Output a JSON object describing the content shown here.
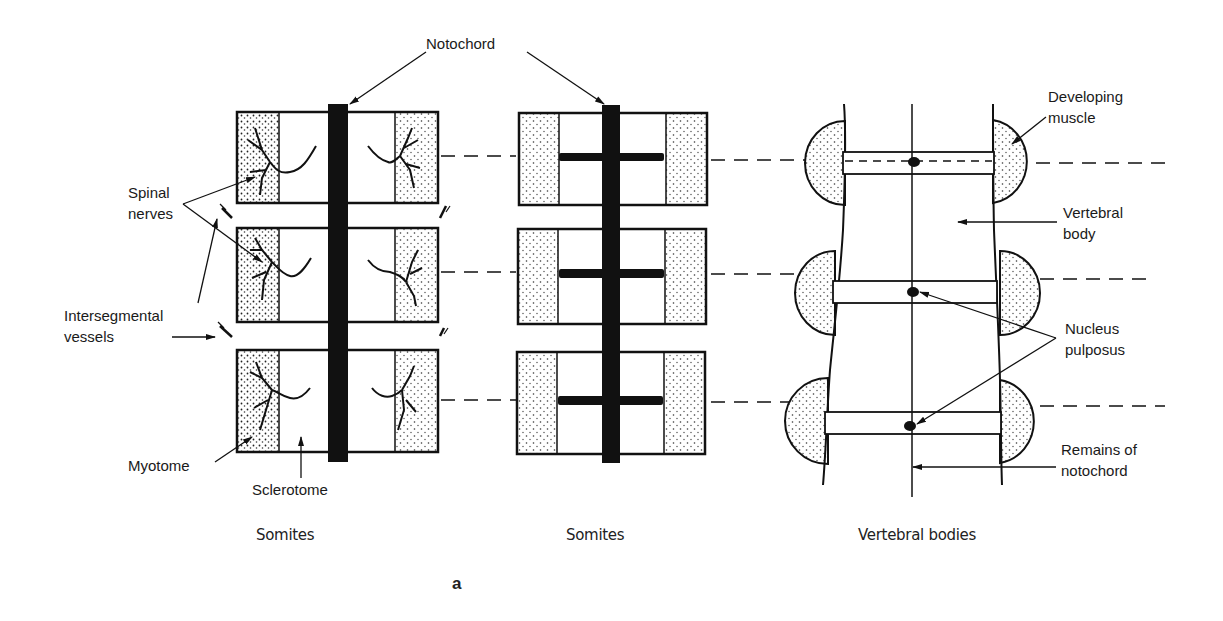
{
  "labels": {
    "notochord": "Notochord",
    "spinal_nerves_1": "Spinal",
    "spinal_nerves_2": "nerves",
    "intersegmental_1": "Intersegmental",
    "intersegmental_2": "vessels",
    "myotome": "Myotome",
    "sclerotome": "Sclerotome",
    "developing_muscle_1": "Developing",
    "developing_muscle_2": "muscle",
    "vertebral_body_1": "Vertebral",
    "vertebral_body_2": "body",
    "nucleus_pulposus_1": "Nucleus",
    "nucleus_pulposus_2": "pulposus",
    "remains_1": "Remains of",
    "remains_2": "notochord"
  },
  "captions": {
    "panel1": "Somites",
    "panel2": "Somites",
    "panel3": "Vertebral bodies"
  },
  "figure_label": "a"
}
